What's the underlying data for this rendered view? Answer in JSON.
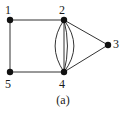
{
  "figure": {
    "caption": "(a)",
    "background_color": "#ffffff",
    "stroke_color": "#333333",
    "node_fill_color": "#111111",
    "label_color": "#1a1a1a"
  },
  "graph": {
    "type": "multigraph",
    "node_radius": 3.2,
    "nodes": [
      {
        "id": "1",
        "label": "1",
        "x": 10,
        "y": 20,
        "label_x": 5,
        "label_y": 4,
        "label_pos": "above-left"
      },
      {
        "id": "2",
        "label": "2",
        "x": 64,
        "y": 20,
        "label_x": 59,
        "label_y": 4,
        "label_pos": "above"
      },
      {
        "id": "3",
        "label": "3",
        "x": 108,
        "y": 45,
        "label_x": 113,
        "label_y": 38,
        "label_pos": "right"
      },
      {
        "id": "4",
        "label": "4",
        "x": 64,
        "y": 72,
        "label_x": 59,
        "label_y": 78,
        "label_pos": "below"
      },
      {
        "id": "5",
        "label": "5",
        "x": 10,
        "y": 72,
        "label_x": 5,
        "label_y": 78,
        "label_pos": "below"
      }
    ],
    "edges": [
      {
        "from": "1",
        "to": "2",
        "kind": "straight",
        "bow": 0
      },
      {
        "from": "1",
        "to": "5",
        "kind": "straight",
        "bow": 0
      },
      {
        "from": "5",
        "to": "4",
        "kind": "straight",
        "bow": 0
      },
      {
        "from": "2",
        "to": "4",
        "kind": "curved",
        "bow": -10
      },
      {
        "from": "2",
        "to": "4",
        "kind": "curved",
        "bow": -3.5
      },
      {
        "from": "2",
        "to": "4",
        "kind": "straight",
        "bow": 0
      },
      {
        "from": "2",
        "to": "4",
        "kind": "curved",
        "bow": 9
      },
      {
        "from": "2",
        "to": "3",
        "kind": "straight",
        "bow": 0
      },
      {
        "from": "4",
        "to": "3",
        "kind": "straight",
        "bow": 0
      }
    ],
    "edge_count_2_4": 4
  }
}
